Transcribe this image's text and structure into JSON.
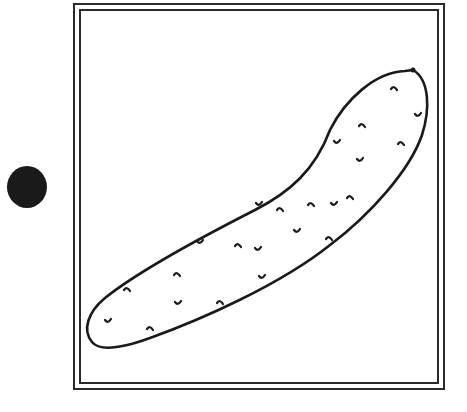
{
  "illustration": {
    "subject": "cucumber",
    "stroke_color": "#1a1a1a",
    "background": "#ffffff",
    "bumps": [
      [
        394,
        88
      ],
      [
        418,
        115
      ],
      [
        362,
        125
      ],
      [
        337,
        142
      ],
      [
        401,
        143
      ],
      [
        360,
        160
      ],
      [
        350,
        197
      ],
      [
        334,
        204
      ],
      [
        311,
        204
      ],
      [
        259,
        204
      ],
      [
        280,
        209
      ],
      [
        297,
        231
      ],
      [
        329,
        238
      ],
      [
        200,
        242
      ],
      [
        238,
        245
      ],
      [
        258,
        249
      ],
      [
        177,
        274
      ],
      [
        262,
        277
      ],
      [
        127,
        289
      ],
      [
        178,
        303
      ],
      [
        220,
        302
      ],
      [
        108,
        321
      ],
      [
        150,
        328
      ]
    ]
  },
  "marker": {
    "shape": "filled-circle",
    "color": "#1a1a1a"
  }
}
